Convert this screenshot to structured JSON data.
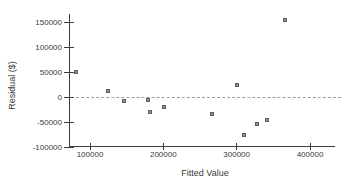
{
  "chart_data": {
    "type": "scatter",
    "title": "",
    "xlabel": "Fitted Value",
    "ylabel": "Residual ($)",
    "xlim": [
      60000,
      420000
    ],
    "ylim": [
      -105000,
      160000
    ],
    "x_ticks": [
      100000,
      200000,
      300000,
      400000
    ],
    "x_tick_labels": [
      "100000",
      "200000",
      "300000",
      "400000"
    ],
    "y_ticks": [
      -100000,
      -50000,
      0,
      50000,
      100000,
      150000
    ],
    "y_tick_labels": [
      "-100000",
      "-50000",
      "0",
      "50000",
      "100000",
      "150000"
    ],
    "grid": false,
    "legend": "none",
    "reference_line": {
      "y": 0,
      "style": "dashed"
    },
    "marker": {
      "shape": "square",
      "size_px": 4
    },
    "points": [
      {
        "x": 81000,
        "y": 52000
      },
      {
        "x": 125000,
        "y": 13000
      },
      {
        "x": 147000,
        "y": -6000
      },
      {
        "x": 179000,
        "y": -5000
      },
      {
        "x": 182000,
        "y": -28000
      },
      {
        "x": 201000,
        "y": -19000
      },
      {
        "x": 266000,
        "y": -33000
      },
      {
        "x": 300000,
        "y": 25000
      },
      {
        "x": 310000,
        "y": -74000
      },
      {
        "x": 328000,
        "y": -53000
      },
      {
        "x": 342000,
        "y": -44000
      },
      {
        "x": 366000,
        "y": 155000
      }
    ],
    "colors": {
      "background": "#ffffff",
      "axis": "#3d3d3d",
      "text": "#3a3a3a",
      "marker_fill": "#929292",
      "marker_border": "#5e5e5e",
      "reference_line": "#9e9e9e"
    }
  }
}
